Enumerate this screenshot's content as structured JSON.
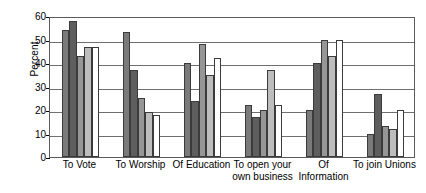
{
  "chart_data": {
    "type": "bar",
    "title": "",
    "xlabel": "",
    "ylabel": "Percent",
    "ylim": [
      0,
      60
    ],
    "yticks": [
      0,
      10,
      20,
      30,
      40,
      50,
      60
    ],
    "ytick_labels": [
      "0",
      "10",
      "20",
      "30",
      "40",
      "50",
      "60"
    ],
    "grid": true,
    "legend": "none",
    "categories": [
      "To Vote",
      "To Worship",
      "Of Education",
      "To open your own business",
      "Of Information",
      "To join Unions"
    ],
    "category_label_lines": [
      [
        "To Vote"
      ],
      [
        "To Worship"
      ],
      [
        "Of Education"
      ],
      [
        "To open your",
        "own business"
      ],
      [
        "Of",
        "Information"
      ],
      [
        "To join Unions"
      ]
    ],
    "series": [
      {
        "name": "Series 1",
        "color": "#7a7a7a",
        "values": [
          54,
          53,
          40,
          22,
          20,
          10
        ]
      },
      {
        "name": "Series 2",
        "color": "#5e5e5e",
        "values": [
          58,
          37,
          24,
          17,
          40,
          27
        ]
      },
      {
        "name": "Series 3",
        "color": "#969696",
        "values": [
          43,
          25,
          48,
          20,
          50,
          13
        ]
      },
      {
        "name": "Series 4",
        "color": "#bdbdbd",
        "values": [
          47,
          19,
          35,
          37,
          43,
          12
        ]
      },
      {
        "name": "Series 5",
        "color": "#ffffff",
        "values": [
          47,
          18,
          42,
          22,
          50,
          20
        ]
      }
    ]
  }
}
